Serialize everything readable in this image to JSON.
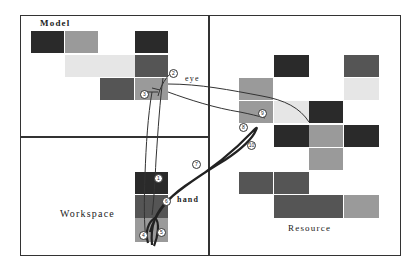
{
  "labels": {
    "model": "Model",
    "workspace": "Workspace",
    "resource": "Resource",
    "eye": "eye",
    "hand": "hand"
  },
  "colors": {
    "dark": "#2a2a2a",
    "darkmid": "#555555",
    "mid": "#9a9a9a",
    "light": "#e6e6e6",
    "line": "#333333"
  },
  "regions": {
    "model": {
      "x": 20,
      "y": 15,
      "w": 189,
      "h": 122
    },
    "workspace": {
      "x": 20,
      "y": 136,
      "w": 189,
      "h": 119
    },
    "resource": {
      "x": 208,
      "y": 15,
      "w": 192,
      "h": 240
    }
  },
  "model_cells": [
    {
      "x": 31,
      "y": 31,
      "w": 33,
      "h": 22,
      "shade": "dark"
    },
    {
      "x": 65,
      "y": 31,
      "w": 33,
      "h": 22,
      "shade": "mid"
    },
    {
      "x": 135,
      "y": 31,
      "w": 33,
      "h": 22,
      "shade": "dark"
    },
    {
      "x": 65,
      "y": 55,
      "w": 70,
      "h": 22,
      "shade": "light"
    },
    {
      "x": 135,
      "y": 55,
      "w": 33,
      "h": 22,
      "shade": "darkmid"
    },
    {
      "x": 100,
      "y": 78,
      "w": 34,
      "h": 22,
      "shade": "darkmid"
    },
    {
      "x": 135,
      "y": 78,
      "w": 33,
      "h": 22,
      "shade": "mid"
    }
  ],
  "resource_cells": [
    {
      "x": 274,
      "y": 55,
      "w": 35,
      "h": 22,
      "shade": "dark"
    },
    {
      "x": 344,
      "y": 55,
      "w": 35,
      "h": 22,
      "shade": "darkmid"
    },
    {
      "x": 239,
      "y": 78,
      "w": 34,
      "h": 22,
      "shade": "mid"
    },
    {
      "x": 344,
      "y": 78,
      "w": 35,
      "h": 22,
      "shade": "light"
    },
    {
      "x": 239,
      "y": 101,
      "w": 34,
      "h": 22,
      "shade": "mid"
    },
    {
      "x": 274,
      "y": 101,
      "w": 35,
      "h": 22,
      "shade": "light"
    },
    {
      "x": 309,
      "y": 101,
      "w": 34,
      "h": 22,
      "shade": "dark"
    },
    {
      "x": 274,
      "y": 125,
      "w": 35,
      "h": 22,
      "shade": "dark"
    },
    {
      "x": 309,
      "y": 125,
      "w": 34,
      "h": 22,
      "shade": "mid"
    },
    {
      "x": 344,
      "y": 125,
      "w": 35,
      "h": 22,
      "shade": "dark"
    },
    {
      "x": 309,
      "y": 148,
      "w": 34,
      "h": 22,
      "shade": "mid"
    },
    {
      "x": 239,
      "y": 172,
      "w": 34,
      "h": 22,
      "shade": "darkmid"
    },
    {
      "x": 274,
      "y": 172,
      "w": 35,
      "h": 22,
      "shade": "darkmid"
    },
    {
      "x": 274,
      "y": 195,
      "w": 35,
      "h": 23,
      "shade": "darkmid"
    },
    {
      "x": 309,
      "y": 195,
      "w": 34,
      "h": 23,
      "shade": "darkmid"
    },
    {
      "x": 344,
      "y": 195,
      "w": 35,
      "h": 23,
      "shade": "mid"
    }
  ],
  "workspace_cells": [
    {
      "x": 135,
      "y": 172,
      "w": 33,
      "h": 22,
      "shade": "dark"
    },
    {
      "x": 135,
      "y": 195,
      "w": 33,
      "h": 23,
      "shade": "darkmid"
    },
    {
      "x": 135,
      "y": 218,
      "w": 33,
      "h": 24,
      "shade": "mid"
    }
  ],
  "markers": [
    {
      "n": "1",
      "x": 158,
      "y": 178
    },
    {
      "n": "2",
      "x": 173,
      "y": 73
    },
    {
      "n": "3",
      "x": 144,
      "y": 94
    },
    {
      "n": "4",
      "x": 143,
      "y": 235
    },
    {
      "n": "5",
      "x": 161,
      "y": 232
    },
    {
      "n": "6",
      "x": 166,
      "y": 201
    },
    {
      "n": "7",
      "x": 196,
      "y": 164
    },
    {
      "n": "8",
      "x": 243,
      "y": 127
    },
    {
      "n": "9",
      "x": 262,
      "y": 113
    },
    {
      "n": "10",
      "x": 251,
      "y": 145
    }
  ]
}
